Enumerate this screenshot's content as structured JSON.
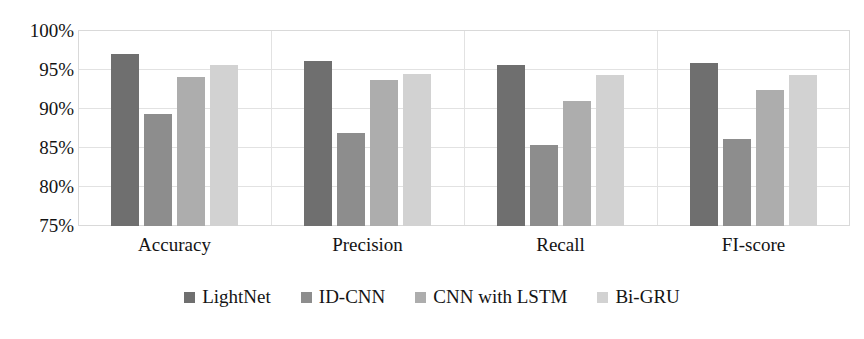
{
  "chart_data": {
    "type": "bar",
    "title": "",
    "subtitle": "",
    "xlabel": "",
    "ylabel": "",
    "categories": [
      "Accuracy",
      "Precision",
      "Recall",
      "FI-score"
    ],
    "series": [
      {
        "name": "LightNet",
        "color": "#6f6f6f",
        "values": [
          96.9,
          96.0,
          95.5,
          95.8
        ]
      },
      {
        "name": "ID-CNN",
        "color": "#8d8d8d",
        "values": [
          89.3,
          86.9,
          85.3,
          86.1
        ]
      },
      {
        "name": "CNN with LSTM",
        "color": "#adadad",
        "values": [
          94.0,
          93.6,
          90.9,
          92.3
        ]
      },
      {
        "name": "Bi-GRU",
        "color": "#d2d2d2",
        "values": [
          95.6,
          94.4,
          94.3,
          94.3
        ]
      }
    ],
    "ylim": [
      75,
      100
    ],
    "ytick_values": [
      100,
      95,
      90,
      85,
      80,
      75
    ],
    "ytick_labels": [
      "100%",
      "95%",
      "90%",
      "85%",
      "80%",
      "75%"
    ],
    "grid": true,
    "grid_color": "#e2e2e2",
    "legend_position": "bottom",
    "background": "#ffffff"
  }
}
